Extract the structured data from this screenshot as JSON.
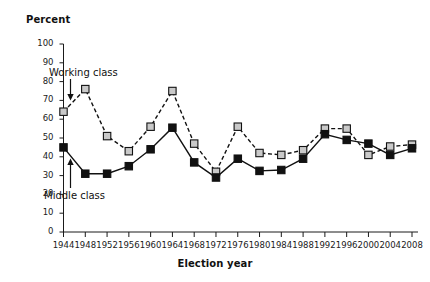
{
  "chart_data": {
    "type": "line",
    "title": "",
    "ylabel": "Percent",
    "xlabel": "Election year",
    "ylim": [
      0,
      100
    ],
    "ytick_step": 10,
    "grid": false,
    "legend_position": "inline-annotations",
    "categories": [
      "1944",
      "1948",
      "1952",
      "1956",
      "1960",
      "1964",
      "1968",
      "1972",
      "1976",
      "1980",
      "1984",
      "1988",
      "1992",
      "1996",
      "2000",
      "2004",
      "2008"
    ],
    "yticks": [
      "0",
      "10",
      "20",
      "30",
      "40",
      "50",
      "60",
      "70",
      "80",
      "90",
      "100"
    ],
    "series": [
      {
        "name": "Working class",
        "marker": "square",
        "marker_fill": "#c9c9c9",
        "marker_stroke": "#111111",
        "line_style": "dashed",
        "line_color": "#111111",
        "values": [
          64,
          76,
          51,
          43,
          56,
          75,
          47,
          32,
          56,
          42,
          41,
          43.5,
          55,
          55,
          41,
          45.5,
          46.5
        ]
      },
      {
        "name": "Middle class",
        "marker": "square",
        "marker_fill": "#111111",
        "marker_stroke": "#111111",
        "line_style": "solid",
        "line_color": "#111111",
        "values": [
          45,
          31,
          31,
          35,
          44,
          55.5,
          37,
          29,
          39,
          32.5,
          33,
          39,
          52,
          49,
          47,
          41,
          44.5
        ]
      }
    ],
    "annotations": [
      {
        "text": "Working class",
        "arrow": "down"
      },
      {
        "text": "Middle class",
        "arrow": "up"
      }
    ]
  },
  "colors": {
    "axis": "#1a1a1a",
    "text": "#111111",
    "working_fill": "#c9c9c9",
    "middle_fill": "#111111",
    "background": "#ffffff"
  }
}
